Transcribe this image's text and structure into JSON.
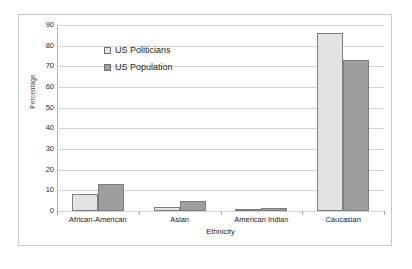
{
  "chart_data": {
    "type": "bar",
    "title": "",
    "xlabel": "Ethnicity",
    "ylabel": "Percentage",
    "categories": [
      "African-American",
      "Asian",
      "American Indian",
      "Caucasian"
    ],
    "series": [
      {
        "name": "US Politicians",
        "color": "#e3e3e3",
        "values": [
          8,
          2,
          0.5,
          86
        ]
      },
      {
        "name": "US Population",
        "color": "#9e9e9e",
        "values": [
          13,
          5,
          1.5,
          73
        ]
      }
    ],
    "ylim": [
      0,
      90
    ],
    "ytick_step": 10,
    "yticks": [
      90,
      80,
      70,
      60,
      50,
      40,
      30,
      20,
      10,
      0
    ],
    "grid": "horizontal",
    "legend_position": "inside-top-left"
  }
}
